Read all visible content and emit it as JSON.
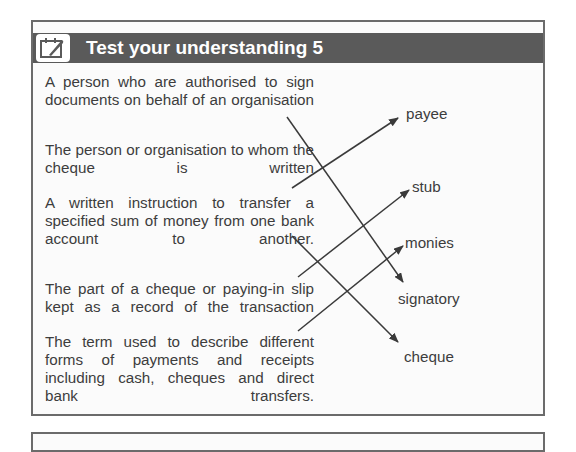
{
  "header": {
    "icon": "notepad-pen-icon",
    "title": "Test your understanding 5"
  },
  "descriptions": [
    "A person who are authorised to sign documents on behalf of an organisation",
    "The person or organisation to whom the cheque is written",
    "A written instruction to transfer a specified sum of money from one bank account to another.",
    "The part of a cheque or paying-in slip kept as a record of the transaction",
    "The term used to describe different forms of payments and receipts including cash, cheques and direct bank transfers."
  ],
  "terms": [
    "payee",
    "stub",
    "monies",
    "signatory",
    "cheque"
  ],
  "matches": [
    {
      "description": 0,
      "term": "signatory"
    },
    {
      "description": 1,
      "term": "payee"
    },
    {
      "description": 2,
      "term": "cheque"
    },
    {
      "description": 3,
      "term": "stub"
    },
    {
      "description": 4,
      "term": "monies"
    }
  ],
  "colors": {
    "header_bg": "#5a5a5a",
    "border": "#6b6b6b",
    "text": "#3d3d3d",
    "line": "#3a3a3a"
  }
}
